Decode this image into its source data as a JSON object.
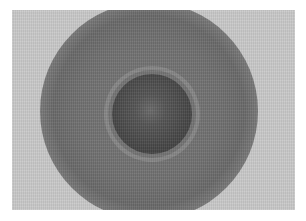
{
  "image": {
    "description": "Grayscale photograph of concentric circular rings: a dark central disk surrounded by a lighter thin ring and a broad darker diffuse halo on a light gray background",
    "colors": {
      "border": "#ffffff",
      "background": "#c9c9c9",
      "halo": "#707070",
      "ring_light": "#969696",
      "core": "#474747",
      "core_center": "#6a6a6a"
    }
  }
}
